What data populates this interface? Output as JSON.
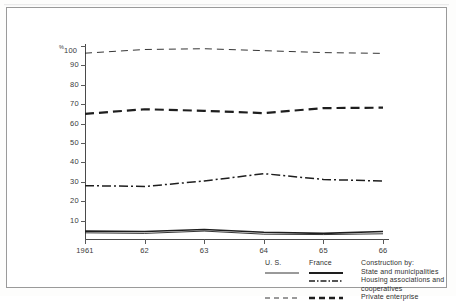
{
  "chart_data": {
    "type": "line",
    "title": "",
    "subtitle": "",
    "xlabel": "",
    "ylabel": "%",
    "axis_unit_label": "%100",
    "x": [
      1961,
      1962,
      1963,
      1964,
      1965,
      1966
    ],
    "xtick_labels": [
      "1961",
      "62",
      "63",
      "64",
      "65",
      "66"
    ],
    "ytick_labels": [
      "100",
      "90",
      "80",
      "70",
      "60",
      "50",
      "40",
      "30",
      "20",
      "10"
    ],
    "ytick_values": [
      100,
      90,
      80,
      70,
      60,
      50,
      40,
      30,
      20,
      10
    ],
    "ylim": [
      0,
      100
    ],
    "xlim": [
      1961,
      1966
    ],
    "grid": false,
    "legend_position": "bottom-right",
    "series": [
      {
        "name": "U.S. Private enterprise",
        "country": "U. S.",
        "category": "Private enterprise",
        "style": "thin-dashed",
        "values": [
          96.3,
          98.2,
          98.6,
          97.6,
          96.6,
          96.2
        ]
      },
      {
        "name": "France Private enterprise",
        "country": "France",
        "category": "Private enterprise",
        "style": "thick-dashed",
        "values": [
          65.0,
          67.4,
          66.6,
          65.4,
          68.0,
          68.2
        ]
      },
      {
        "name": "France Housing associations and cooperatives",
        "country": "France",
        "category": "Housing associations and cooperatives",
        "style": "dash-dot",
        "values": [
          28.0,
          27.6,
          30.4,
          34.2,
          31.2,
          30.4
        ]
      },
      {
        "name": "France State and municipalities",
        "country": "France",
        "category": "State and municipalities",
        "style": "solid",
        "values": [
          4.6,
          4.4,
          5.4,
          4.0,
          3.4,
          4.4
        ]
      },
      {
        "name": "U.S. State and municipalities",
        "country": "U. S.",
        "category": "State and municipalities",
        "style": "solid-thin",
        "values": [
          3.7,
          3.4,
          4.6,
          3.0,
          2.8,
          3.2
        ]
      }
    ]
  },
  "legend": {
    "col_us": "U. S.",
    "col_france": "France",
    "title": "Construction by:",
    "rows": [
      {
        "label": "State and municipalities",
        "us_style": "solid-thin",
        "fr_style": "solid-thick"
      },
      {
        "label": "Housing associations and",
        "us_style": "none",
        "fr_style": "dash-dot"
      },
      {
        "label": "cooperatives",
        "us_style": "none",
        "fr_style": "none"
      },
      {
        "label": "Private enterprise",
        "us_style": "thin-dashed",
        "fr_style": "thick-dashed"
      }
    ]
  },
  "colors": {
    "line": "#1e1e1e",
    "axis": "#4a4a4a",
    "text": "#2f2f2f",
    "frame": "#9a9a9a",
    "background": "#ffffff"
  }
}
